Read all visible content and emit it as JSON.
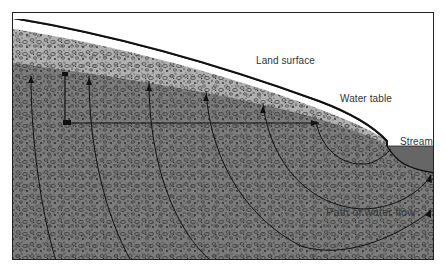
{
  "figure": {
    "type": "cross-section diagram",
    "labels": {
      "land_surface": "Land surface",
      "water_table": "Water table",
      "stream": "Stream",
      "path_of_water_flow": "Path of water flow"
    },
    "colors": {
      "border": "#222222",
      "unsaturated_zone": "#a9a9a9",
      "saturated_zone": "#7a7a7a",
      "stream_water": "#6a6a6a",
      "flow_lines": "#111111",
      "background": "#ffffff"
    },
    "elements": [
      "land-surface-boundary",
      "unsaturated-zone",
      "water-table-boundary",
      "saturated-zone",
      "stream-channel",
      "flow-paths",
      "head-measurement-lines"
    ]
  }
}
